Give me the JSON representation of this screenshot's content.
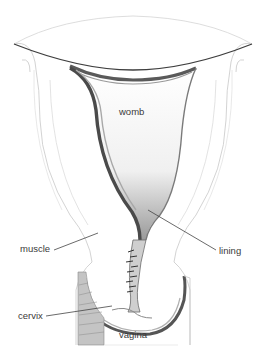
{
  "diagram": {
    "labels": {
      "womb": "womb",
      "muscle": "muscle",
      "lining": "lining",
      "cervix": "cervix",
      "vagina": "vagina"
    },
    "colors": {
      "background": "#ffffff",
      "outline": "#b8b8b8",
      "shading": "#6e6e6e",
      "dark_lining": "#4a4a4a",
      "label_text": "#3a3a3a",
      "leader_line": "#444444"
    }
  }
}
